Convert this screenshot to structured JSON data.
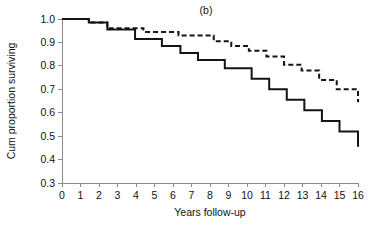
{
  "chart_data": {
    "type": "line",
    "title": "(b)",
    "xlabel": "Years follow-up",
    "ylabel": "Cum proportion surviving",
    "xlim": [
      0,
      16
    ],
    "ylim": [
      0.3,
      1.0
    ],
    "xticks": [
      "0",
      "1",
      "2",
      "3",
      "4",
      "5",
      "6",
      "7",
      "8",
      "9",
      "10",
      "11",
      "12",
      "13",
      "14",
      "15",
      "16"
    ],
    "yticks": [
      "0.3",
      "0.4",
      "0.5",
      "0.6",
      "0.7",
      "0.8",
      "0.9",
      "1.0"
    ],
    "grid": false,
    "legend": "none",
    "step_style": "post",
    "series": [
      {
        "name": "solid-curve",
        "style": "solid",
        "color": "#141414",
        "x": [
          0.0,
          1.0,
          1.45,
          2.0,
          2.45,
          3.0,
          3.95,
          4.45,
          5.4,
          6.4,
          7.35,
          8.3,
          8.8,
          9.3,
          10.25,
          11.2,
          12.15,
          13.1,
          14.05,
          15.0,
          16.0
        ],
        "y": [
          1.0,
          1.0,
          0.985,
          0.985,
          0.955,
          0.955,
          0.915,
          0.915,
          0.885,
          0.855,
          0.825,
          0.825,
          0.79,
          0.79,
          0.745,
          0.7,
          0.655,
          0.61,
          0.565,
          0.52,
          0.455
        ]
      },
      {
        "name": "dashed-curve",
        "style": "dashed",
        "color": "#141414",
        "x": [
          0.0,
          1.0,
          1.45,
          2.0,
          2.45,
          3.45,
          4.4,
          5.35,
          6.3,
          7.25,
          8.2,
          9.15,
          10.1,
          11.05,
          12.0,
          12.95,
          13.9,
          14.85,
          16.0
        ],
        "y": [
          1.0,
          1.0,
          0.985,
          0.985,
          0.96,
          0.96,
          0.945,
          0.945,
          0.93,
          0.93,
          0.905,
          0.885,
          0.865,
          0.84,
          0.805,
          0.78,
          0.74,
          0.7,
          0.645
        ]
      }
    ]
  },
  "plot_geometry": {
    "left": 62,
    "right": 358,
    "top": 19,
    "bottom": 183
  }
}
